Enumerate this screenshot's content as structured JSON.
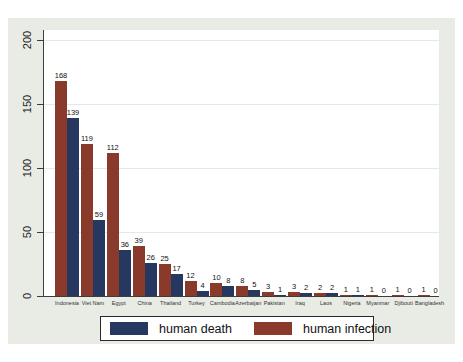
{
  "figure": {
    "background_color": "#e9ebe5",
    "plot_background_color": "#ffffff",
    "axis_color": "#3c3c3c",
    "grid_color": "#e3e8ea",
    "text_color": "#1c1c1c"
  },
  "chart_data": {
    "type": "bar",
    "title": "",
    "xlabel": "",
    "ylabel": "",
    "categories": [
      "Indonesia",
      "Viet Nam",
      "Egypt",
      "China",
      "Thailand",
      "Turkey",
      "Cambodia",
      "Azerbaijan",
      "Pakistan",
      "Iraq",
      "Laos",
      "Nigeria",
      "Myanmar",
      "Djibouti",
      "Bangladesh"
    ],
    "series": [
      {
        "name": "human infection",
        "color": "#8a3a2b",
        "values": [
          168,
          119,
          112,
          39,
          25,
          12,
          10,
          8,
          3,
          3,
          2,
          1,
          1,
          1,
          1
        ]
      },
      {
        "name": "human death",
        "color": "#263760",
        "values": [
          139,
          59,
          36,
          26,
          17,
          4,
          8,
          5,
          1,
          2,
          2,
          1,
          0,
          0,
          0
        ]
      }
    ],
    "bar_value_labels_shown": true,
    "y_ticks": [
      0,
      50,
      100,
      150,
      200
    ],
    "ylim": [
      0,
      208
    ],
    "grid": "faint-horizontal",
    "legend_position": "bottom"
  },
  "legend": {
    "items": [
      {
        "label": "human death",
        "color": "#263760"
      },
      {
        "label": "human infection",
        "color": "#8a3a2b"
      }
    ]
  }
}
